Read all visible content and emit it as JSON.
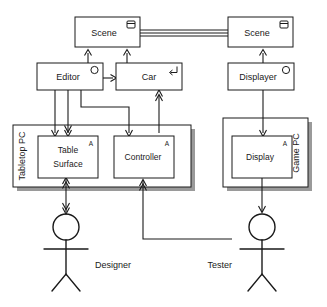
{
  "diagram": {
    "nodes": {
      "scene_left": {
        "label": "Scene",
        "icon": "data-store-icon"
      },
      "scene_right": {
        "label": "Scene",
        "icon": "data-store-icon"
      },
      "editor": {
        "label": "Editor",
        "icon": "active-class-circle-icon"
      },
      "car": {
        "label": "Car",
        "icon": "reactive-return-arrow-icon"
      },
      "displayer": {
        "label": "Displayer",
        "icon": "active-class-circle-icon"
      },
      "table_surface": {
        "label_line1": "Table",
        "label_line2": "Surface",
        "marker": "A"
      },
      "controller": {
        "label": "Controller",
        "marker": "A"
      },
      "display": {
        "label": "Display",
        "marker": "A"
      }
    },
    "containers": {
      "tabletop_pc": {
        "label": "Tabletop PC"
      },
      "game_pc": {
        "label": "Game PC"
      }
    },
    "actors": {
      "designer": {
        "label": "Designer"
      },
      "tester": {
        "label": "Tester"
      }
    },
    "colors": {
      "stroke": "#1a1a1a",
      "fill": "#ffffff",
      "shadow": "#9a9a9a"
    }
  }
}
